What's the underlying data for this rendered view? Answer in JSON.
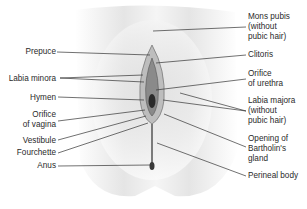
{
  "figure": {
    "type": "anatomical-diagram",
    "background": "#ffffff",
    "line_color": "#333333",
    "text_color": "#2a2a2a"
  },
  "labels_left": [
    {
      "id": "prepuce",
      "text": "Prepuce",
      "x": 4,
      "y": 47,
      "w": 52,
      "to": [
        [
          57,
          52,
          150,
          55
        ]
      ]
    },
    {
      "id": "labia-minora",
      "text": "Labia minora",
      "x": 4,
      "y": 74,
      "w": 52,
      "to": [
        [
          60,
          78,
          143,
          75
        ],
        [
          60,
          78,
          144,
          82
        ]
      ]
    },
    {
      "id": "hymen",
      "text": "Hymen",
      "x": 4,
      "y": 93,
      "w": 52,
      "to": [
        [
          58,
          97,
          144,
          100
        ]
      ]
    },
    {
      "id": "orifice-of-vagina",
      "text": "Orifice\nof vagina",
      "x": 4,
      "y": 110,
      "w": 52,
      "to": [
        [
          58,
          121,
          145,
          110
        ]
      ]
    },
    {
      "id": "vestibule",
      "text": "Vestibule",
      "x": 4,
      "y": 136,
      "w": 52,
      "to": [
        [
          58,
          140,
          146,
          116
        ]
      ]
    },
    {
      "id": "fourchette",
      "text": "Fourchette",
      "x": 4,
      "y": 148,
      "w": 52,
      "to": [
        [
          58,
          153,
          148,
          123
        ]
      ]
    },
    {
      "id": "anus",
      "text": "Anus",
      "x": 4,
      "y": 161,
      "w": 52,
      "to": [
        [
          58,
          166,
          151,
          165
        ]
      ]
    }
  ],
  "labels_right": [
    {
      "id": "mons-pubis",
      "text": "Mons pubis\n(without\npubic hair)",
      "x": 248,
      "y": 12,
      "to": [
        [
          246,
          27,
          153,
          31
        ]
      ]
    },
    {
      "id": "clitoris",
      "text": "Clitoris",
      "x": 248,
      "y": 50,
      "to": [
        [
          246,
          55,
          156,
          63
        ]
      ]
    },
    {
      "id": "orifice-of-urethra",
      "text": "Orifice\nof urethra",
      "x": 248,
      "y": 69,
      "to": [
        [
          246,
          79,
          156,
          90
        ]
      ]
    },
    {
      "id": "labia-majora",
      "text": "Labia majora\n(without\npubic hair)",
      "x": 248,
      "y": 96,
      "to": [
        [
          246,
          111,
          180,
          93
        ],
        [
          246,
          111,
          163,
          100
        ]
      ]
    },
    {
      "id": "opening-of-bartholins-gland",
      "text": "Opening of\nBartholin's\ngland",
      "x": 248,
      "y": 134,
      "to": [
        [
          246,
          147,
          164,
          114
        ]
      ]
    },
    {
      "id": "perineal-body",
      "text": "Perineal body",
      "x": 248,
      "y": 171,
      "to": [
        [
          246,
          176,
          157,
          143
        ]
      ]
    }
  ]
}
